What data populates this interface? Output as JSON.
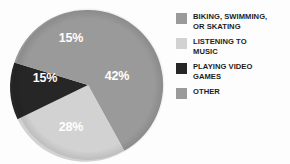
{
  "chart_data": {
    "type": "pie",
    "title": "",
    "categories": [
      "Biking, swimming, or skating",
      "Listening to music",
      "Playing video games",
      "Other"
    ],
    "values": [
      42,
      28,
      15,
      15
    ],
    "value_unit": "%",
    "data_labels": [
      "42%",
      "28%",
      "15%",
      "15%"
    ],
    "colors": [
      "#9a9a9a",
      "#d2d2d2",
      "#262626",
      "#9a9a9a"
    ],
    "start_angle_deg": 0,
    "direction": "clockwise",
    "legend_position": "right",
    "grid": false,
    "xlabel": "",
    "ylabel": ""
  },
  "slices": [
    {
      "name": "biking-swimming-skating",
      "label": "42%",
      "value": 42,
      "color": "#9a9a9a",
      "path": "M 88 85 L 88 10 A 75 75 0 0 1 124.3 150.7 Z",
      "label_x": 117,
      "label_y": 77
    },
    {
      "name": "listening-to-music",
      "label": "28%",
      "value": 28,
      "color": "#d2d2d2",
      "path": "M 88 85 L 124.3 150.7 A 75 75 0 0 1 17.5 119.3 Z",
      "label_x": 71,
      "label_y": 128
    },
    {
      "name": "playing-video-games",
      "label": "15%",
      "value": 15,
      "color": "#262626",
      "path": "M 88 85 L 17.5 119.3 A 75 75 0 0 1 14.3 62.6 Z",
      "label_x": 45,
      "label_y": 79
    },
    {
      "name": "other",
      "label": "15%",
      "value": 15,
      "color": "#9a9a9a",
      "path": "M 88 85 L 14.3 62.6 A 75 75 0 0 1 88 10 Z",
      "label_x": 71,
      "label_y": 39
    }
  ],
  "legend": {
    "items": [
      {
        "label": "Biking, swimming,\nor skating",
        "color": "#9a9a9a"
      },
      {
        "label": "Listening to\nmusic",
        "color": "#d2d2d2"
      },
      {
        "label": "Playing video\ngames",
        "color": "#262626"
      },
      {
        "label": "Other",
        "color": "#9a9a9a"
      }
    ]
  }
}
